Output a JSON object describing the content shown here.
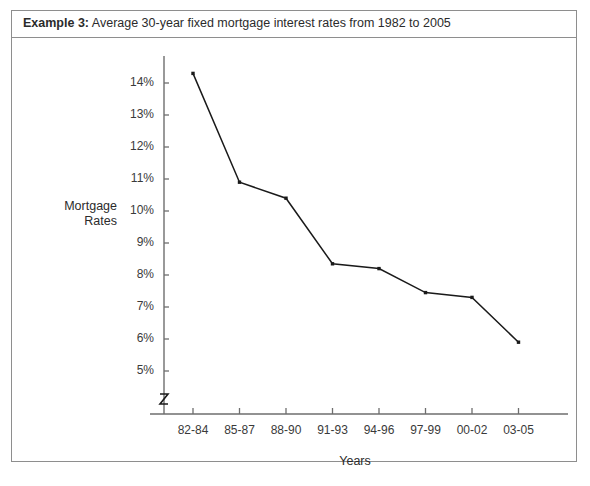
{
  "caption": {
    "label": "Example 3:",
    "text": "Average 30-year fixed mortgage interest rates from 1982 to 2005"
  },
  "chart_data": {
    "type": "line",
    "title": "Average 30-year fixed mortgage interest rates from 1982 to 2005",
    "xlabel": "Years",
    "ylabel": "Mortgage Rates",
    "ylabel_line1": "Mortgage",
    "ylabel_line2": "Rates",
    "categories": [
      "82-84",
      "85-87",
      "88-90",
      "91-93",
      "94-96",
      "97-99",
      "00-02",
      "03-05"
    ],
    "values": [
      14.3,
      10.9,
      10.4,
      8.35,
      8.2,
      7.45,
      7.3,
      5.9
    ],
    "ytick_labels": [
      "14%",
      "13%",
      "12%",
      "11%",
      "10%",
      "9%",
      "8%",
      "7%",
      "6%",
      "5%"
    ],
    "ytick_values": [
      14,
      13,
      12,
      11,
      10,
      9,
      8,
      7,
      6,
      5
    ],
    "ylim": [
      5,
      14
    ],
    "grid": false,
    "legend": false,
    "axis_break": true,
    "axis_break_symbol": "zigzag",
    "line_color": "#1a1a1a",
    "marker": "square",
    "marker_color": "#1a1a1a",
    "axis_color": "#6e6e6e"
  },
  "colors": {
    "frame_border": "#8e8e8e",
    "text": "#2b2b2b",
    "background": "#ffffff"
  }
}
